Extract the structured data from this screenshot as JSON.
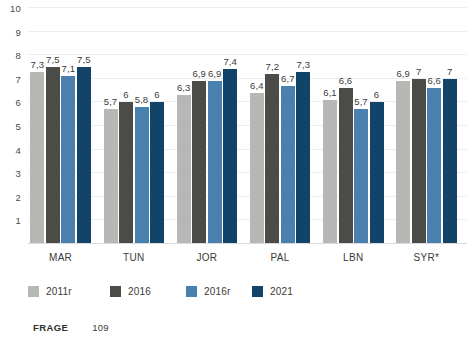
{
  "chart_data": {
    "type": "bar",
    "title": "",
    "subtitle": "",
    "xlabel": "",
    "ylabel": "",
    "ylim": [
      0,
      10
    ],
    "yticks": [
      1,
      2,
      3,
      4,
      5,
      6,
      7,
      8,
      9,
      10
    ],
    "ytick_labels": [
      "1",
      "2",
      "3",
      "4",
      "5",
      "6",
      "7",
      "8",
      "9",
      "10"
    ],
    "grid": true,
    "legend_position": "bottom-left",
    "categories": [
      "MAR",
      "TUN",
      "JOR",
      "PAL",
      "LBN",
      "SYR*"
    ],
    "series": [
      {
        "name": "2011r",
        "color": "#b7b7b5",
        "values": [
          7.3,
          5.7,
          6.3,
          6.4,
          6.1,
          6.9
        ],
        "labels": [
          "7,3",
          "5,7",
          "6,3",
          "6,4",
          "6,1",
          "6,9"
        ]
      },
      {
        "name": "2016",
        "color": "#4b4b47",
        "values": [
          7.5,
          6.0,
          6.9,
          7.2,
          6.6,
          7.0
        ],
        "labels": [
          "7,5",
          "6",
          "6,9",
          "7,2",
          "6,6",
          "7"
        ]
      },
      {
        "name": "2016r",
        "color": "#4a80ad",
        "values": [
          7.1,
          5.8,
          6.9,
          6.7,
          5.7,
          6.6
        ],
        "labels": [
          "7,1",
          "5,8",
          "6,9",
          "6,7",
          "5,7",
          "6,6"
        ]
      },
      {
        "name": "2021",
        "color": "#114468",
        "values": [
          7.5,
          6.0,
          7.4,
          7.3,
          6.0,
          7.0
        ],
        "labels": [
          "7,5",
          "6",
          "7,4",
          "7,3",
          "6",
          "7"
        ]
      }
    ]
  },
  "footer": {
    "key": "FRAGE",
    "value": "109"
  },
  "colors": {
    "series_2011r": "#b7b7b5",
    "series_2016": "#4b4b47",
    "series_2016r": "#4a80ad",
    "series_2021": "#114468",
    "gridline": "#eceef0",
    "axis_text": "#3a3a38"
  }
}
